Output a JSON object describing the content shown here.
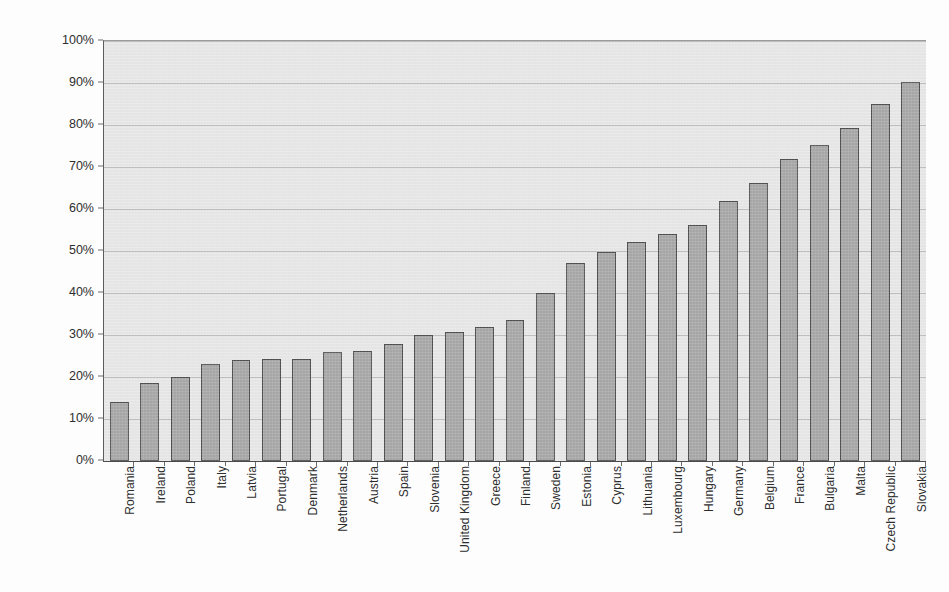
{
  "chart_data": {
    "type": "bar",
    "title": "",
    "xlabel": "",
    "ylabel": "% of area farmed by tenants",
    "ylim": [
      0,
      100
    ],
    "ytick_labels": [
      "0%",
      "10%",
      "20%",
      "30%",
      "40%",
      "50%",
      "60%",
      "70%",
      "80%",
      "90%",
      "100%"
    ],
    "ytick_values": [
      0,
      10,
      20,
      30,
      40,
      50,
      60,
      70,
      80,
      90,
      100
    ],
    "grid": "horizontal",
    "legend": "none",
    "categories": [
      "Romania",
      "Ireland",
      "Poland",
      "Italy",
      "Latvia",
      "Portugal",
      "Denmark",
      "Netherlands",
      "Austria",
      "Spain",
      "Slovenia",
      "United Kingdom",
      "Greece",
      "Finland",
      "Sweden",
      "Estonia",
      "Cyprus",
      "Lithuania",
      "Luxembourg",
      "Hungary",
      "Germany",
      "Belgium",
      "France",
      "Bulgaria",
      "Malta",
      "Czech Republic",
      "Slovakia"
    ],
    "values": [
      14,
      18.5,
      20,
      23,
      24,
      24.3,
      24.4,
      26,
      26.2,
      27.8,
      30,
      30.7,
      32,
      33.5,
      40,
      47.2,
      49.7,
      52.2,
      54,
      56.3,
      62,
      66.3,
      71.8,
      75.2,
      79.4,
      85,
      90.2
    ],
    "value_unit": "%",
    "bar_color": "#a9a9a9",
    "bar_border_color": "#4f4f4f",
    "plot_background_color": "#e9e9e9",
    "gridline_color": "#c0c0c0",
    "axis_color": "#4a4a4a"
  }
}
